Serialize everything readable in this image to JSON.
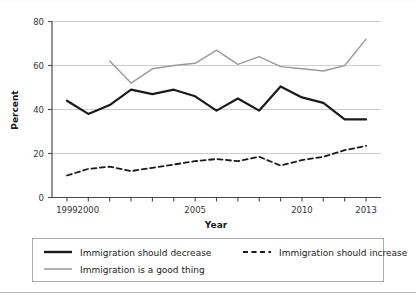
{
  "chart_data": {
    "type": "line",
    "title": "",
    "xlabel": "Year",
    "ylabel": "Percent",
    "xlim": [
      1998.3,
      2013.7
    ],
    "ylim": [
      0,
      80
    ],
    "yticks": [
      0,
      20,
      40,
      60,
      80
    ],
    "ytick_labels": [
      "0",
      "20",
      "40",
      "60",
      "80"
    ],
    "xticks": [
      1999,
      2000,
      2001,
      2002,
      2003,
      2004,
      2005,
      2006,
      2007,
      2008,
      2009,
      2010,
      2011,
      2012,
      2013
    ],
    "xtick_labels_shown": [
      "1999",
      "2000",
      "2005",
      "2010",
      "2013"
    ],
    "xtick_labeled_values": [
      1999,
      2000,
      2005,
      2010,
      2013
    ],
    "grid": "horizontal",
    "legend_position": "below-plot",
    "series": [
      {
        "name": "Immigration should decrease",
        "style": "solid",
        "color": "#1a1a1a",
        "width": 2.2,
        "x": [
          1999,
          2000,
          2001,
          2002,
          2003,
          2004,
          2005,
          2006,
          2007,
          2008,
          2009,
          2010,
          2011,
          2012,
          2013
        ],
        "values": [
          44,
          38,
          42,
          49,
          47,
          49,
          46,
          39.5,
          45,
          39.5,
          50.5,
          45.5,
          43,
          35.5,
          35.5
        ]
      },
      {
        "name": "Immigration should increase",
        "style": "dashed",
        "color": "#1a1a1a",
        "width": 1.8,
        "x": [
          1999,
          2000,
          2001,
          2002,
          2003,
          2004,
          2005,
          2006,
          2007,
          2008,
          2009,
          2010,
          2011,
          2012,
          2013
        ],
        "values": [
          10,
          13,
          14,
          12,
          13.5,
          15,
          16.5,
          17.5,
          16.5,
          18.5,
          14.5,
          17,
          18.5,
          21.5,
          23.5
        ]
      },
      {
        "name": "Immigration is a good thing",
        "style": "solid",
        "color": "#9a9a9a",
        "width": 1.4,
        "x": [
          2001,
          2002,
          2003,
          2004,
          2005,
          2006,
          2007,
          2008,
          2009,
          2010,
          2011,
          2012,
          2013
        ],
        "values": [
          62,
          52,
          58.5,
          60,
          61,
          67,
          60.5,
          64,
          59.5,
          58.5,
          57.5,
          60,
          72
        ]
      }
    ]
  },
  "legend": {
    "entries": [
      {
        "label": "Immigration should decrease",
        "style": "solid",
        "color": "#1a1a1a"
      },
      {
        "label": "Immigration should increase",
        "style": "dashed",
        "color": "#1a1a1a"
      },
      {
        "label": "Immigration is a good thing",
        "style": "solid",
        "color": "#9a9a9a"
      }
    ]
  },
  "axes": {
    "x_title": "Year",
    "y_title": "Percent"
  }
}
